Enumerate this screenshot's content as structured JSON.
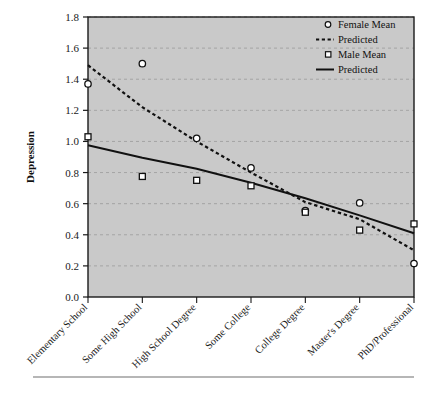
{
  "figure": {
    "background_color": "#ffffff",
    "plot_background_color": "#c9c9c9",
    "frame_color": "#1a1a1a",
    "gridline_color": "#a9a9a9",
    "series_color": "#111111"
  },
  "axes": {
    "ylabel": "Depression",
    "ytick_labels": [
      "0.0",
      "0.2",
      "0.4",
      "0.6",
      "0.8",
      "1.0",
      "1.2",
      "1.4",
      "1.6",
      "1.8"
    ],
    "xtick_labels": [
      "Elementary School",
      "Some High School",
      "High School Degree",
      "Some College",
      "College Degree",
      "Master's Degree",
      "PhD/Professional"
    ]
  },
  "legend": {
    "entries": [
      {
        "label": "Female Mean",
        "marker": "open-circle-marker"
      },
      {
        "label": "Predicted",
        "marker": "dashed-line-swatch"
      },
      {
        "label": "Male Mean",
        "marker": "open-square-marker"
      },
      {
        "label": "Predicted",
        "marker": "solid-line-swatch"
      }
    ]
  },
  "chart_data": {
    "type": "scatter",
    "title": "",
    "xlabel": "",
    "ylabel": "Depression",
    "ylim": [
      0.0,
      1.8
    ],
    "ytick_step": 0.2,
    "grid": true,
    "legend_position": "top-right",
    "categories": [
      "Elementary School",
      "Some High School",
      "High School Degree",
      "Some College",
      "College Degree",
      "Master's Degree",
      "PhD/Professional"
    ],
    "series": [
      {
        "name": "Female Mean",
        "kind": "scatter",
        "marker": "open-circle",
        "values": [
          1.37,
          1.5,
          1.02,
          0.83,
          0.555,
          0.605,
          0.215
        ]
      },
      {
        "name": "Predicted",
        "kind": "line",
        "linestyle": "dashed",
        "group": "Female",
        "values": [
          1.49,
          1.22,
          1.0,
          0.8,
          0.61,
          0.5,
          0.3
        ]
      },
      {
        "name": "Male Mean",
        "kind": "scatter",
        "marker": "open-square",
        "values": [
          1.03,
          0.775,
          0.75,
          0.715,
          0.545,
          0.43,
          0.47
        ]
      },
      {
        "name": "Predicted",
        "kind": "line",
        "linestyle": "solid",
        "group": "Male",
        "values": [
          0.975,
          0.895,
          0.825,
          0.735,
          0.635,
          0.525,
          0.41
        ]
      }
    ]
  },
  "caption": {
    "rule_visible": true,
    "text": ""
  }
}
